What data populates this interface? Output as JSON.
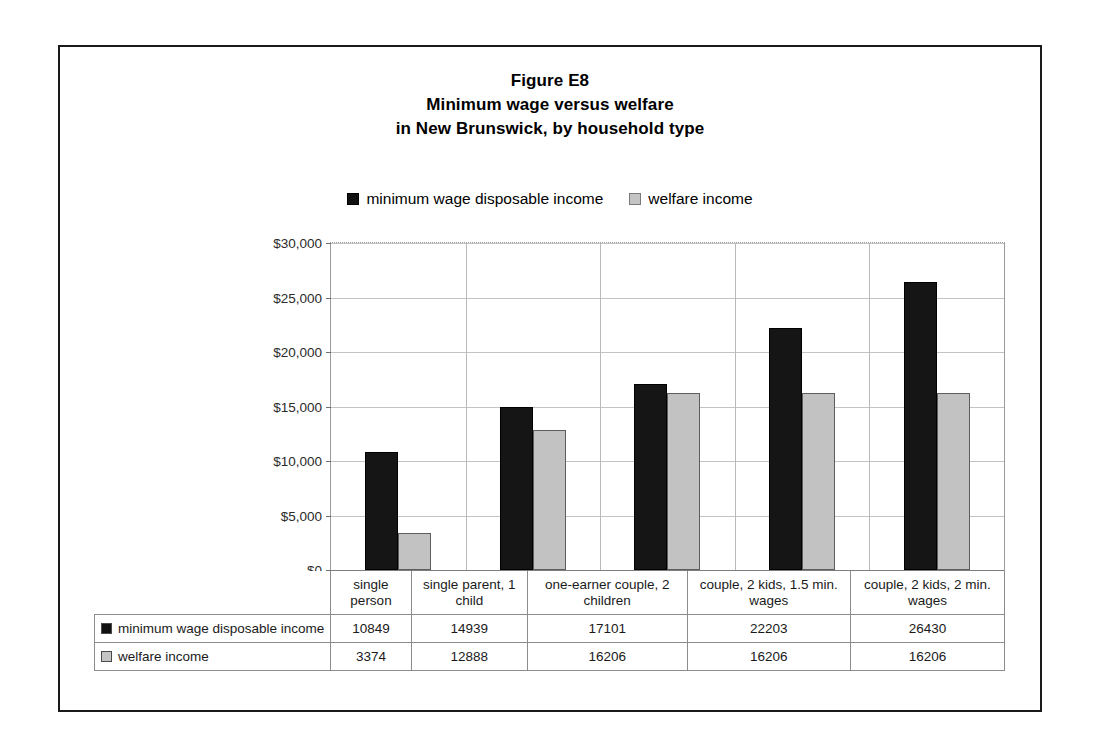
{
  "figure": {
    "title_lines": [
      "Figure E8",
      "Minimum wage versus welfare",
      "in New Brunswick, by household type"
    ]
  },
  "legend": {
    "entries": [
      {
        "label": "minimum wage disposable income",
        "swatch": "black-square-icon",
        "color": "#151515"
      },
      {
        "label": "welfare income",
        "swatch": "gray-square-icon",
        "color": "#c2c2c2"
      }
    ]
  },
  "axis": {
    "y_ticks": [
      "$0",
      "$5,000",
      "$10,000",
      "$15,000",
      "$20,000",
      "$25,000",
      "$30,000"
    ]
  },
  "table": {
    "row_header_labels": [
      "minimum wage disposable income",
      "welfare income"
    ],
    "rows": [
      {
        "label": "minimum wage disposable income",
        "values": [
          "10849",
          "14939",
          "17101",
          "22203",
          "26430"
        ]
      },
      {
        "label": "welfare income",
        "values": [
          "3374",
          "12888",
          "16206",
          "16206",
          "16206"
        ]
      }
    ]
  },
  "chart_data": {
    "type": "bar",
    "xlabel": "",
    "ylabel": "",
    "ylim": [
      0,
      30000
    ],
    "ytick_step": 5000,
    "grid": true,
    "legend_position": "top-center",
    "categories": [
      "single person",
      "single parent, 1 child",
      "one-earner couple, 2 children",
      "couple, 2 kids, 1.5 min. wages",
      "couple, 2 kids, 2 min. wages"
    ],
    "series": [
      {
        "name": "minimum wage disposable income",
        "color": "#151515",
        "values": [
          10849,
          14939,
          17101,
          22203,
          26430
        ]
      },
      {
        "name": "welfare income",
        "color": "#c2c2c2",
        "values": [
          3374,
          12888,
          16206,
          16206,
          16206
        ]
      }
    ]
  }
}
